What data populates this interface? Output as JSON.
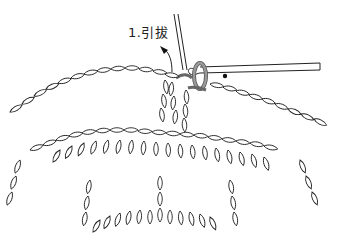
{
  "diagram": {
    "type": "crochet-stitch-illustration",
    "step_label": "1.引拔",
    "caption": "",
    "elements": [
      "crochet-hook",
      "working-yarn",
      "chain-loops",
      "double-crochet-stitches",
      "highlighted-slip-stitch-loop",
      "insertion-point-dot",
      "pointer-arrow"
    ],
    "colors": {
      "line": "#222222",
      "fill": "#ffffff",
      "highlight_loop": "#8a8a8a"
    }
  }
}
